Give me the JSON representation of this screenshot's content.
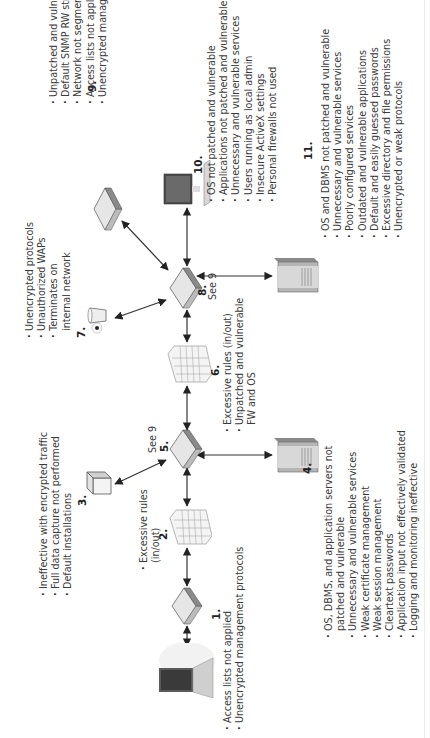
{
  "diagram": {
    "orientation": "rotated 90 degrees counter-clockwise",
    "nodes": [
      {
        "id": "laptop",
        "number": "",
        "type": "laptop",
        "notes": []
      },
      {
        "id": "1",
        "number": "1.",
        "type": "router",
        "notes": [
          "Access lists not applied",
          "Unencrypted management protocols"
        ]
      },
      {
        "id": "2",
        "number": "2.",
        "type": "firewall",
        "notes": [
          "Excessive rules",
          "(in/out)"
        ]
      },
      {
        "id": "3",
        "number": "3.",
        "type": "ids-box",
        "notes": [
          "Ineffective with encrypted traffic",
          "Full data capture not performed",
          "Default installations"
        ]
      },
      {
        "id": "4",
        "number": "4.",
        "type": "server",
        "notes": [
          "OS, DBMS, and application servers not",
          "patched and vulnerable",
          "Unnecessary and vulnerable services",
          "Weak certificate management",
          "Weak session management",
          "Cleartext passwords",
          "Application input not effectively validated",
          "Logging and monitoring ineffective"
        ]
      },
      {
        "id": "5",
        "number": "5.",
        "type": "router",
        "see": "See 9",
        "notes": []
      },
      {
        "id": "6",
        "number": "6.",
        "type": "firewall",
        "notes": [
          "Excessive rules (in/out)",
          "Unpatched and vulnerable",
          "FW and OS"
        ]
      },
      {
        "id": "7",
        "number": "7.",
        "type": "wireless-access-point",
        "notes": [
          "Unencrypted protocols",
          "Unauthorized WAPs",
          "Terminates on",
          "internal network"
        ]
      },
      {
        "id": "8",
        "number": "8.",
        "type": "router",
        "see": "See 9",
        "notes": []
      },
      {
        "id": "9",
        "number": "9.",
        "type": "switch",
        "notes": [
          "Unpatched and vulnerable services",
          "Default SNMP RW strings",
          "Network not segmented",
          "Access lists not applied",
          "Unencrypted management protocols"
        ]
      },
      {
        "id": "10",
        "number": "10.",
        "type": "desktop",
        "notes": [
          "OS not patched and vulnerable",
          "Applications not patched and vulnerable",
          "Unnecessary and vulnerable services",
          "Users running as local admin",
          "Insecure ActiveX settings",
          "Personal firewalls not used"
        ]
      },
      {
        "id": "11",
        "number": "11.",
        "type": "server",
        "notes": [
          "OS and DBMS not patched and vulnerable",
          "Unnecessary and vulnerable services",
          "Poorly configured services",
          "Outdated and vulnerable applications",
          "Default and easily guessed passwords",
          "Excessive directory and file permissions",
          "Unencrypted or weak protocols"
        ]
      }
    ],
    "edges": [
      [
        "laptop",
        "1"
      ],
      [
        "1",
        "2"
      ],
      [
        "2",
        "5"
      ],
      [
        "5",
        "3"
      ],
      [
        "5",
        "4"
      ],
      [
        "5",
        "6"
      ],
      [
        "6",
        "8"
      ],
      [
        "8",
        "7"
      ],
      [
        "8",
        "9"
      ],
      [
        "8",
        "10"
      ],
      [
        "8",
        "11"
      ]
    ]
  },
  "labels": {
    "n1": "1.",
    "n2": "2.",
    "n3": "3.",
    "n4": "4.",
    "n5": "5.",
    "n6": "6.",
    "n7": "7.",
    "n8": "8.",
    "n9": "9.",
    "n10": "10.",
    "n11": "11.",
    "see5": "See 9",
    "see8": "See 9",
    "notes1": [
      "Access lists not applied",
      "Unencrypted management protocols"
    ],
    "notes2": [
      "Excessive rules",
      "(in/out)"
    ],
    "notes3": [
      "Ineffective with encrypted traffic",
      "Full data capture not performed",
      "Default installations"
    ],
    "notes4": [
      "OS, DBMS, and application servers not",
      "patched and vulnerable",
      "Unnecessary and vulnerable services",
      "Weak certificate management",
      "Weak session management",
      "Cleartext passwords",
      "Application input not effectively validated",
      "Logging and monitoring ineffective"
    ],
    "notes6": [
      "Excessive rules (in/out)",
      "Unpatched and vulnerable",
      "FW and OS"
    ],
    "notes7": [
      "Unencrypted protocols",
      "Unauthorized WAPs",
      "Terminates on",
      "internal network"
    ],
    "notes9": [
      "Unpatched and vulnerable services",
      "Default SNMP RW strings",
      "Network not segmented",
      "Access lists not applied",
      "Unencrypted management protocols"
    ],
    "notes10": [
      "OS not patched and vulnerable",
      "Applications not patched and vulnerable",
      "Unnecessary and vulnerable services",
      "Users running as local admin",
      "Insecure ActiveX settings",
      "Personal firewalls not used"
    ],
    "notes11": [
      "OS and DBMS not patched and vulnerable",
      "Unnecessary and vulnerable services",
      "Poorly configured services",
      "Outdated and vulnerable applications",
      "Default and easily guessed passwords",
      "Excessive directory and file permissions",
      "Unencrypted or weak protocols"
    ]
  },
  "colors": {
    "text": "#3a3a3a",
    "line": "#333333",
    "device_light": "#e8e8e8",
    "device_dark": "#555555"
  }
}
